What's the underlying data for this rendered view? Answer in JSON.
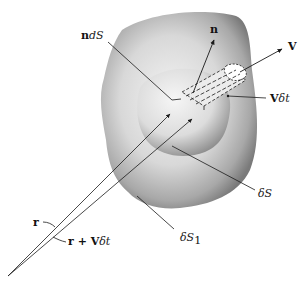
{
  "figure": {
    "labels": {
      "n_dS": {
        "bold": "n",
        "italic": "dS"
      },
      "n": "n",
      "V": "V",
      "V_dt": {
        "bold": "V",
        "italic": "δt"
      },
      "delta_S": {
        "italic": "δS"
      },
      "delta_S1": {
        "italic": "δS",
        "sub": "1"
      },
      "r": "r",
      "r_plus_Vdt": {
        "bold": "r + V",
        "italic": "δt"
      }
    },
    "colors": {
      "background": "#ffffff",
      "outer_surface": "#9a9a9a",
      "inner_surface": "#c8c8c8",
      "lines": "#1a1a1a"
    }
  }
}
